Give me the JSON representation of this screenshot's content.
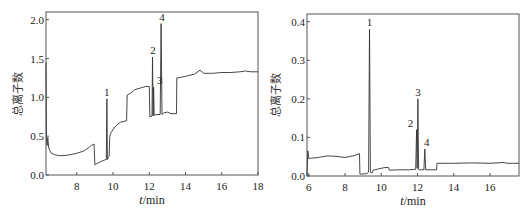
{
  "chart_data": [
    {
      "type": "line",
      "title": "",
      "xlabel": "t/min",
      "ylabel": "总离子数",
      "xlim": [
        6.3,
        18
      ],
      "ylim": [
        0,
        2.1
      ],
      "xticks": [
        8,
        10,
        12,
        14,
        16,
        18
      ],
      "yticks": [
        0.0,
        0.5,
        1.0,
        1.5,
        2.0
      ],
      "ytick_labels": [
        "0.0",
        "0.5",
        "1.0",
        "1.5",
        "2.0"
      ],
      "grid": false,
      "peaks": [
        {
          "label": "1",
          "x": 9.65,
          "y": 0.98
        },
        {
          "label": "2",
          "x": 12.2,
          "y": 1.52
        },
        {
          "label": "3",
          "x": 12.3,
          "y": 1.13
        },
        {
          "label": "4",
          "x": 12.7,
          "y": 1.95
        }
      ],
      "x": [
        6.3,
        6.32,
        6.36,
        6.4,
        6.45,
        6.5,
        6.6,
        6.8,
        7.0,
        7.3,
        7.6,
        8.0,
        8.4,
        8.7,
        8.8,
        8.95,
        9.0,
        9.05,
        9.3,
        9.6,
        9.63,
        9.66,
        9.69,
        9.72,
        9.78,
        9.82,
        9.9,
        10.1,
        10.4,
        10.75,
        10.78,
        11.0,
        11.2,
        11.5,
        11.8,
        12.0,
        12.03,
        12.15,
        12.18,
        12.21,
        12.24,
        12.27,
        12.3,
        12.33,
        12.36,
        12.6,
        12.65,
        12.7,
        12.75,
        12.8,
        13.0,
        13.2,
        13.5,
        13.52,
        14.0,
        14.5,
        14.8,
        15.0,
        15.5,
        16.0,
        16.5,
        17.0,
        17.3,
        17.6,
        18.0
      ],
      "values": [
        1.45,
        0.5,
        0.38,
        0.48,
        0.35,
        0.32,
        0.28,
        0.26,
        0.25,
        0.25,
        0.26,
        0.28,
        0.31,
        0.36,
        0.38,
        0.4,
        0.13,
        0.14,
        0.17,
        0.2,
        0.2,
        0.98,
        0.2,
        0.22,
        0.24,
        0.5,
        0.55,
        0.62,
        0.68,
        0.7,
        1.03,
        1.06,
        1.1,
        1.12,
        1.14,
        1.14,
        0.75,
        0.76,
        1.52,
        0.76,
        1.13,
        0.77,
        0.77,
        0.77,
        0.78,
        0.78,
        1.95,
        0.78,
        0.79,
        0.8,
        0.81,
        0.79,
        0.79,
        1.25,
        1.27,
        1.3,
        1.35,
        1.31,
        1.31,
        1.32,
        1.32,
        1.33,
        1.34,
        1.33,
        1.33
      ]
    },
    {
      "type": "line",
      "title": "",
      "xlabel": "t/min",
      "ylabel": "总离子数",
      "xlim": [
        5.9,
        17.6
      ],
      "ylim": [
        0,
        0.42
      ],
      "xticks": [
        6,
        8,
        10,
        12,
        14,
        16
      ],
      "yticks": [
        0.0,
        0.1,
        0.2,
        0.3,
        0.4
      ],
      "ytick_labels": [
        "0.0",
        "0.1",
        "0.2",
        "0.3",
        "0.4"
      ],
      "grid": false,
      "peaks": [
        {
          "label": "1",
          "x": 9.35,
          "y": 0.38
        },
        {
          "label": "2",
          "x": 11.95,
          "y": 0.12
        },
        {
          "label": "3",
          "x": 12.02,
          "y": 0.2
        },
        {
          "label": "4",
          "x": 12.4,
          "y": 0.07
        }
      ],
      "x": [
        5.9,
        5.95,
        6.0,
        6.1,
        6.5,
        7.0,
        7.5,
        8.0,
        8.5,
        8.8,
        8.82,
        9.2,
        9.3,
        9.35,
        9.4,
        9.5,
        9.55,
        9.8,
        10.2,
        10.4,
        10.45,
        11.0,
        11.5,
        11.85,
        11.9,
        11.95,
        11.98,
        12.02,
        12.06,
        12.1,
        12.35,
        12.4,
        12.45,
        12.8,
        13.05,
        13.07,
        14.0,
        15.0,
        16.0,
        16.7,
        17.0,
        17.6
      ],
      "values": [
        0.0,
        0.065,
        0.045,
        0.046,
        0.048,
        0.052,
        0.051,
        0.048,
        0.053,
        0.058,
        0.005,
        0.006,
        0.01,
        0.38,
        0.01,
        0.008,
        0.015,
        0.018,
        0.022,
        0.022,
        0.015,
        0.016,
        0.016,
        0.017,
        0.017,
        0.12,
        0.02,
        0.2,
        0.017,
        0.016,
        0.016,
        0.07,
        0.016,
        0.016,
        0.016,
        0.033,
        0.033,
        0.034,
        0.033,
        0.035,
        0.033,
        0.033
      ]
    }
  ]
}
